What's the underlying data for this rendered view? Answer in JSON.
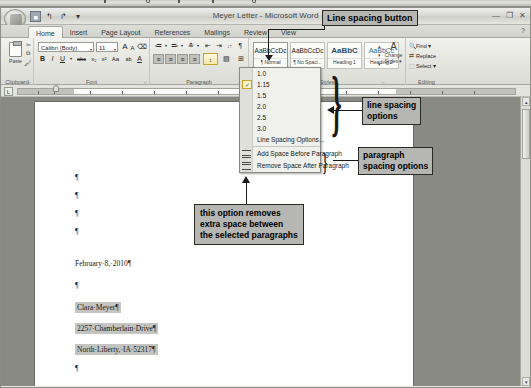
{
  "window": {
    "title": "Meyer Letter - Microsoft Word",
    "minimize": "—",
    "restore": "❐",
    "close": "✕",
    "help": "?"
  },
  "quick_access": {
    "save": "💾",
    "undo": "↰",
    "redo": "↱",
    "customize": "▾"
  },
  "tabs": [
    {
      "label": "Home",
      "active": true
    },
    {
      "label": "Insert",
      "active": false
    },
    {
      "label": "Page Layout",
      "active": false
    },
    {
      "label": "References",
      "active": false
    },
    {
      "label": "Mailings",
      "active": false
    },
    {
      "label": "Review",
      "active": false
    },
    {
      "label": "View",
      "active": false
    }
  ],
  "ribbon": {
    "clipboard": {
      "group_label": "Clipboard",
      "paste_label": "Paste",
      "cut_icon": "✂",
      "copy_icon": "⧉",
      "format_painter_icon": "🖌",
      "launcher": "⌐"
    },
    "font": {
      "group_label": "Font",
      "font_name": "Calibri (Body)",
      "font_size": "11",
      "grow_font": "A",
      "shrink_font": "A",
      "clear_formatting": "⌫",
      "bold": "B",
      "italic": "I",
      "underline": "U",
      "strikethrough": "abc",
      "subscript": "x₂",
      "superscript": "x²",
      "change_case": "Aa",
      "highlight": "ab",
      "font_color": "A",
      "launcher": "⌐"
    },
    "paragraph": {
      "group_label": "Paragraph",
      "bullets": "≔",
      "numbering": "≕",
      "multilevel_list": "≛",
      "decrease_indent": "⇤",
      "increase_indent": "⇥",
      "sort": "↓↑",
      "show_marks": "¶",
      "align_left": "≡",
      "align_center": "≡",
      "align_right": "≡",
      "justify": "≡",
      "line_spacing": "↕",
      "shading": "▨",
      "borders": "⊞",
      "launcher": "⌐"
    },
    "styles": {
      "group_label": "Styles",
      "items": [
        {
          "sample": "AaBbCcDc",
          "name": "¶ Normal",
          "kind": "normal"
        },
        {
          "sample": "AaBbCcDc",
          "name": "¶ No Spaci...",
          "kind": "normal"
        },
        {
          "sample": "AaBbC",
          "name": "Heading 1",
          "kind": "h1"
        },
        {
          "sample": "AaBbCc",
          "name": "Heading 2",
          "kind": "h2"
        }
      ],
      "scroll_up": "▴",
      "scroll_down": "▾",
      "more": "▾",
      "change_styles_icon": "A",
      "change_styles_label": "Change Styles ▾",
      "launcher": "⌐"
    },
    "editing": {
      "group_label": "Editing",
      "find": "Find ▾",
      "replace": "Replace",
      "select": "Select ▾",
      "find_icon": "🔍",
      "replace_icon": "⇄",
      "select_icon": "⬚"
    }
  },
  "ruler": {
    "tab_stop_button": "L"
  },
  "line_spacing_menu": {
    "values": [
      {
        "label": "1.0",
        "checked": false
      },
      {
        "label": "1.15",
        "checked": true
      },
      {
        "label": "1.5",
        "checked": false
      },
      {
        "label": "2.0",
        "checked": false
      },
      {
        "label": "2.5",
        "checked": false
      },
      {
        "label": "3.0",
        "checked": false
      }
    ],
    "check_glyph": "✓",
    "options_item": "Line Spacing Options...",
    "add_space_before": "Add Space Before Paragraph",
    "add_space_before_parts": {
      "pre": "Add Space ",
      "key": "B",
      "post": "efore Paragraph"
    },
    "remove_space_after": "Remove Space After Paragraph",
    "remove_space_after_parts": {
      "pre": "Remove Space ",
      "key": "A",
      "post": "fter Paragraph"
    }
  },
  "document": {
    "lines": [
      {
        "text": "¶",
        "y": 154,
        "highlight": false
      },
      {
        "text": "¶",
        "y": 172,
        "highlight": false
      },
      {
        "text": "¶",
        "y": 190,
        "highlight": false
      },
      {
        "text": "¶",
        "y": 208,
        "highlight": false
      },
      {
        "text": "February·8,·2010¶",
        "y": 240,
        "highlight": false
      },
      {
        "text": "¶",
        "y": 262,
        "highlight": false
      },
      {
        "text": "Clara·Meyer¶",
        "y": 283,
        "highlight": true
      },
      {
        "text": "2257·Chamberlain·Drive¶",
        "y": 304,
        "highlight": true
      },
      {
        "text": "North·Liberty,·IA·52317¶",
        "y": 325,
        "highlight": true
      },
      {
        "text": "¶",
        "y": 345,
        "highlight": false
      },
      {
        "text": "Dear·Clara:¶",
        "y": 368,
        "highlight": false
      }
    ]
  },
  "annotations": {
    "line_spacing_button": "Line spacing button",
    "line_spacing_options_l1": "line spacing",
    "line_spacing_options_l2": "options",
    "paragraph_spacing_l1": "paragraph",
    "paragraph_spacing_l2": "spacing options",
    "removes_space_l1": "this option removes",
    "removes_space_l2": "extra space between",
    "removes_space_l3": "the selected paragraphs"
  },
  "scrollbar": {
    "up_arrow": "▴",
    "down_arrow": "▾"
  }
}
